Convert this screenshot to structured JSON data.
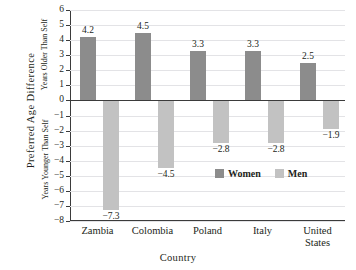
{
  "chart_data": {
    "type": "bar",
    "title": "",
    "categories": [
      "Zambia",
      "Colombia",
      "Poland",
      "Italy",
      "United States"
    ],
    "category_lines": [
      [
        "Zambia"
      ],
      [
        "Colombia"
      ],
      [
        "Poland"
      ],
      [
        "Italy"
      ],
      [
        "United",
        "States"
      ]
    ],
    "series": [
      {
        "name": "Women",
        "values": [
          4.2,
          4.5,
          3.3,
          3.3,
          2.5
        ],
        "color": "#8c8c8c"
      },
      {
        "name": "Men",
        "values": [
          -7.3,
          -4.5,
          -2.8,
          -2.8,
          -1.9
        ],
        "color": "#c2c2c2"
      }
    ],
    "value_labels": {
      "women": [
        "4.2",
        "4.5",
        "3.3",
        "3.3",
        "2.5"
      ],
      "men": [
        "−7.3",
        "−4.5",
        "−2.8",
        "−2.8",
        "−1.9"
      ]
    },
    "xlabel": "Country",
    "ylabel": "Preferred Age Difference",
    "ylabel_positive_direction": "Years Older Than Self",
    "ylabel_negative_direction": "Years Younger Than Self",
    "ylim": [
      -8,
      6
    ],
    "yticks": [
      6,
      5,
      4,
      3,
      2,
      1,
      0,
      -1,
      -2,
      -3,
      -4,
      -5,
      -6,
      -7,
      -8
    ],
    "ytick_labels": [
      "6",
      "5",
      "4",
      "3",
      "2",
      "1",
      "0",
      "−1",
      "−2",
      "−3",
      "−4",
      "−5",
      "−6",
      "−7",
      "−8"
    ],
    "grid": true,
    "grid_color": "#e3e3e6",
    "axis_color": "#3b3b3b",
    "legend_position": "inside-right-lower",
    "legend": [
      "Women",
      "Men"
    ]
  }
}
